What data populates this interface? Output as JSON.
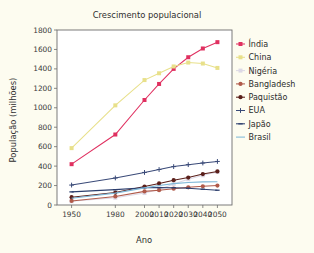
{
  "chart_data": {
    "type": "line",
    "title": "Crescimento populacional",
    "xlabel": "Ano",
    "ylabel": "População (milhões)",
    "x": [
      1950,
      1980,
      2000,
      2010,
      2020,
      2030,
      2040,
      2050
    ],
    "xtick_labels": [
      "1950",
      "1980",
      "2000",
      "2010",
      "2020",
      "2030",
      "2040",
      "2050"
    ],
    "ytick_labels": [
      "0",
      "200",
      "400",
      "600",
      "800",
      "1000",
      "1200",
      "1400",
      "1600",
      "1800"
    ],
    "yticks": [
      0,
      200,
      400,
      600,
      800,
      1000,
      1200,
      1400,
      1600,
      1800
    ],
    "ylim": [
      0,
      1800
    ],
    "xlim": [
      1940,
      2060
    ],
    "grid": false,
    "legend_position": "right",
    "series": [
      {
        "name": "Índia",
        "color": "#e03060",
        "marker": "square",
        "values": [
          420,
          725,
          1080,
          1245,
          1400,
          1520,
          1610,
          1675
        ]
      },
      {
        "name": "China",
        "color": "#e8e08a",
        "marker": "square",
        "values": [
          585,
          1025,
          1285,
          1355,
          1425,
          1465,
          1455,
          1410
        ]
      },
      {
        "name": "Nigéria",
        "color": "#ddd9e6",
        "marker": "square",
        "values": [
          38,
          75,
          123,
          160,
          215,
          265,
          305,
          340
        ]
      },
      {
        "name": "Bangladesh",
        "color": "#b05a4a",
        "marker": "circle",
        "values": [
          42,
          88,
          140,
          152,
          168,
          182,
          192,
          200
        ]
      },
      {
        "name": "Paquistão",
        "color": "#5a1f1a",
        "marker": "circle",
        "values": [
          80,
          128,
          190,
          222,
          255,
          282,
          318,
          345
        ]
      },
      {
        "name": "EUA",
        "color": "#3a4a78",
        "marker": "plus",
        "values": [
          205,
          278,
          335,
          365,
          395,
          415,
          432,
          448
        ]
      },
      {
        "name": "Japão",
        "color": "#2d3f6e",
        "marker": "dash",
        "values": [
          135,
          158,
          178,
          180,
          178,
          172,
          162,
          152
        ]
      },
      {
        "name": "Brasil",
        "color": "#7fb8d8",
        "marker": "line",
        "values": [
          70,
          122,
          176,
          200,
          220,
          232,
          238,
          240
        ]
      }
    ]
  }
}
